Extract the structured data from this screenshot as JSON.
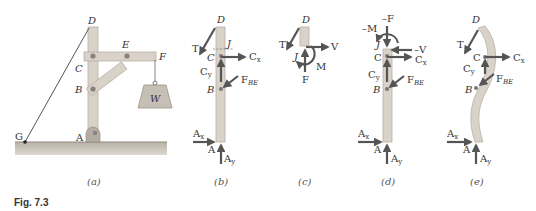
{
  "figure": {
    "caption": "Fig. 7.3",
    "colors": {
      "member": "#d9d2c9",
      "member_stroke": "#b8b0a6",
      "ground": "#c9c2b8",
      "arrow": "#555555",
      "pin": "#8a8178",
      "weight": "#c6bfb5",
      "text": "#333333"
    }
  },
  "panels": {
    "a": {
      "caption": "(a)",
      "labels": {
        "D": "D",
        "E": "E",
        "F": "F",
        "C": "C",
        "B": "B",
        "A": "A",
        "G": "G",
        "W": "W"
      }
    },
    "b": {
      "caption": "(b)",
      "labels": {
        "D": "D",
        "T": "T",
        "J": "J",
        "C": "C",
        "Cx": "C",
        "Cx_sub": "x",
        "Cy": "C",
        "Cy_sub": "y",
        "B": "B",
        "FBE": "F",
        "FBE_sub": "BE",
        "Ax": "A",
        "Ax_sub": "x",
        "A": "A",
        "Ay": "A",
        "Ay_sub": "y"
      }
    },
    "c": {
      "caption": "(c)",
      "labels": {
        "D": "D",
        "T": "T",
        "J": "J",
        "V": "V",
        "M": "M",
        "F": "F"
      }
    },
    "d": {
      "caption": "(d)",
      "labels": {
        "negM": "–M",
        "negF": "–F",
        "J": "J",
        "negV": "–V",
        "C": "C",
        "Cx": "C",
        "Cx_sub": "x",
        "Cy": "C",
        "Cy_sub": "y",
        "B": "B",
        "FBE": "F",
        "FBE_sub": "BE",
        "Ax": "A",
        "Ax_sub": "x",
        "A": "A",
        "Ay": "A",
        "Ay_sub": "y"
      }
    },
    "e": {
      "caption": "(e)",
      "labels": {
        "D": "D",
        "T": "T",
        "C": "C",
        "Cx": "C",
        "Cx_sub": "x",
        "Cy": "C",
        "Cy_sub": "y",
        "B": "B",
        "FBE": "F",
        "FBE_sub": "BE",
        "Ax": "A",
        "Ax_sub": "x",
        "A": "A",
        "Ay": "A",
        "Ay_sub": "y"
      }
    }
  }
}
